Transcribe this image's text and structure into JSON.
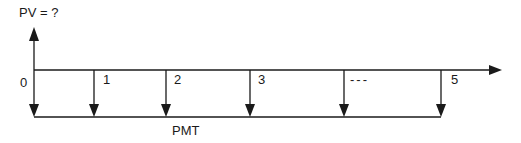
{
  "diagram": {
    "type": "cash-flow-timeline",
    "present_value_label": "PV = ?",
    "payment_label": "PMT",
    "periods": [
      {
        "label": "0",
        "x": 34
      },
      {
        "label": "1",
        "x": 94
      },
      {
        "label": "2",
        "x": 166
      },
      {
        "label": "3",
        "x": 250
      },
      {
        "label": "---",
        "x": 344
      },
      {
        "label": "5",
        "x": 441
      }
    ],
    "colors": {
      "line": "#1a1a1a",
      "background": "#ffffff"
    }
  }
}
